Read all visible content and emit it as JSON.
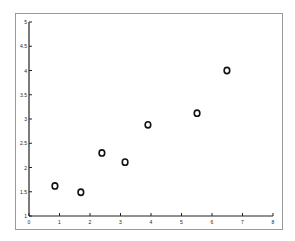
{
  "chart_data": {
    "type": "scatter",
    "title": "",
    "xlabel": "",
    "ylabel": "",
    "xlim": [
      0,
      8
    ],
    "ylim": [
      1,
      5
    ],
    "grid": false,
    "legend": null,
    "marker": "o",
    "x_ticks": [
      "0",
      "1",
      "2",
      "3",
      "4",
      "5",
      "6",
      "7",
      "8"
    ],
    "y_ticks": [
      "1",
      "1.5",
      "2",
      "2.5",
      "3",
      "3.5",
      "4",
      "4.5",
      "5"
    ],
    "points": [
      {
        "x": 0.85,
        "y": 1.62
      },
      {
        "x": 1.7,
        "y": 1.49
      },
      {
        "x": 2.39,
        "y": 2.3
      },
      {
        "x": 3.15,
        "y": 2.11
      },
      {
        "x": 3.9,
        "y": 2.88
      },
      {
        "x": 5.51,
        "y": 3.12
      },
      {
        "x": 6.49,
        "y": 4.0
      }
    ],
    "colors": {
      "marker": "#111111",
      "axis": "#222222",
      "frame": "#9a9a9a"
    }
  }
}
